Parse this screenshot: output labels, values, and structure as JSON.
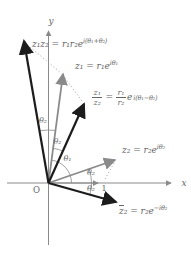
{
  "figure": {
    "name": "complex-number-product-quotient-conjugate-diagram",
    "axes": {
      "x_label": "x",
      "y_label": "y",
      "origin_label": "O",
      "unit_label": "1"
    },
    "formulas": {
      "product": {
        "base": "z₁z₂ = r₁r₂e",
        "exp": "i(θ₁+θ₂)"
      },
      "z1": {
        "base": "z₁ = r₁e",
        "exp": "iθ₁"
      },
      "quotient": {
        "num_left": "z₁",
        "den_left": "z₂",
        "equals": "=",
        "num_right": "r₁",
        "den_right": "r₂",
        "e": "e",
        "exp": "i(θ₁−θ₂)"
      },
      "z2": {
        "base": "z₂ = r₂e",
        "exp": "iθ₂"
      },
      "z2_conjugate": {
        "zbar": "z",
        "after_bar": "₂ = r₂e",
        "exp": "−iθ₂"
      }
    },
    "angle_labels": {
      "between_product_and_z1": "θ₂",
      "between_z1_and_quotient": "θ₂",
      "theta1": "θ₁",
      "above_x_axis": "θ₂",
      "below_x_axis": "θ₂"
    },
    "colors": {
      "black_vector": "#1c1c1c",
      "gray_vector": "#8a8a8a",
      "text": "#666666",
      "background": "#ffffff"
    }
  }
}
